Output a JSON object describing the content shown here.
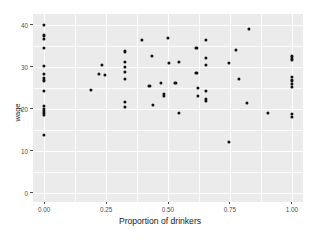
{
  "chart_data": {
    "type": "scatter",
    "title": "",
    "xlabel": "Proportion of drinkers",
    "ylabel": "wage",
    "xlim": [
      -0.045,
      1.045
    ],
    "ylim": [
      -2.2,
      42.5
    ],
    "xticks": [
      0.0,
      0.25,
      0.5,
      0.75,
      1.0
    ],
    "xticklabels": [
      "0.00",
      "0.25",
      "0.50",
      "0.75",
      "1.00"
    ],
    "yticks": [
      0,
      10,
      20,
      30,
      40
    ],
    "yticklabels": [
      "0",
      "10",
      "20",
      "30",
      "40"
    ],
    "grid": true,
    "grid_major_color": "#ffffff",
    "grid_minor_color": "#ffffff",
    "panel_background": "#ebebeb",
    "point_color": "#111111",
    "legend": null,
    "points": [
      [
        0.0,
        40.0
      ],
      [
        0.0,
        37.4
      ],
      [
        0.0,
        36.6
      ],
      [
        0.0,
        34.4
      ],
      [
        0.0,
        30.2
      ],
      [
        0.0,
        28.2
      ],
      [
        0.0,
        27.4
      ],
      [
        0.0,
        26.7
      ],
      [
        0.0,
        24.3
      ],
      [
        0.0,
        20.6
      ],
      [
        0.0,
        20.0
      ],
      [
        0.0,
        19.4
      ],
      [
        0.0,
        18.9
      ],
      [
        0.0,
        18.4
      ],
      [
        0.0,
        13.7
      ],
      [
        0.19,
        24.5
      ],
      [
        0.22,
        28.2
      ],
      [
        0.235,
        30.3
      ],
      [
        0.245,
        28.1
      ],
      [
        0.325,
        33.6
      ],
      [
        0.325,
        31.2
      ],
      [
        0.325,
        29.9
      ],
      [
        0.325,
        28.7
      ],
      [
        0.325,
        27.0
      ],
      [
        0.325,
        21.6
      ],
      [
        0.325,
        20.3
      ],
      [
        0.395,
        36.3
      ],
      [
        0.435,
        32.5
      ],
      [
        0.425,
        25.4
      ],
      [
        0.44,
        20.9
      ],
      [
        0.47,
        26.2
      ],
      [
        0.485,
        23.5
      ],
      [
        0.485,
        23.0
      ],
      [
        0.5,
        36.7
      ],
      [
        0.505,
        30.9
      ],
      [
        0.545,
        31.2
      ],
      [
        0.53,
        26.1
      ],
      [
        0.545,
        18.9
      ],
      [
        0.615,
        34.5
      ],
      [
        0.615,
        28.4
      ],
      [
        0.62,
        25.0
      ],
      [
        0.62,
        23.1
      ],
      [
        0.655,
        36.4
      ],
      [
        0.655,
        32.1
      ],
      [
        0.655,
        30.4
      ],
      [
        0.655,
        24.2
      ],
      [
        0.655,
        22.3
      ],
      [
        0.655,
        21.8
      ],
      [
        0.745,
        30.9
      ],
      [
        0.745,
        12.0
      ],
      [
        0.775,
        34.0
      ],
      [
        0.785,
        27.1
      ],
      [
        0.825,
        39.0
      ],
      [
        0.82,
        21.4
      ],
      [
        0.905,
        18.9
      ],
      [
        1.0,
        32.4
      ],
      [
        1.0,
        31.7
      ],
      [
        1.0,
        27.6
      ],
      [
        1.0,
        26.7
      ],
      [
        1.0,
        25.8
      ],
      [
        1.0,
        25.1
      ],
      [
        1.0,
        18.7
      ],
      [
        1.0,
        18.1
      ]
    ]
  }
}
